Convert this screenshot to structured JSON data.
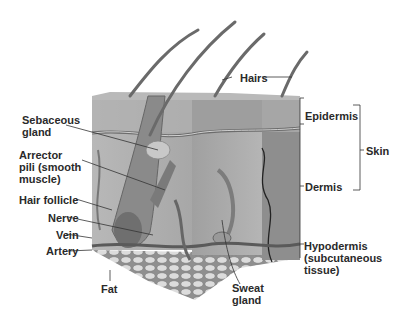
{
  "diagram": {
    "colors": {
      "background": "#ffffff",
      "skin_light": "#c4c4c4",
      "skin_mid": "#a9a9a9",
      "skin_dark": "#8a8a8a",
      "fat": "#d8d8d8",
      "label": "#2a2a2a",
      "leader": "#333333"
    },
    "labels": {
      "hairs": "Hairs",
      "epidermis": "Epidermis",
      "skin": "Skin",
      "dermis": "Dermis",
      "hypodermis_1": "Hypodermis",
      "hypodermis_2": "(subcutaneous",
      "hypodermis_3": "tissue)",
      "sebaceous_1": "Sebaceous",
      "sebaceous_2": "gland",
      "arrector_1": "Arrector",
      "arrector_2": "pili (smooth",
      "arrector_3": "muscle)",
      "hair_follicle": "Hair follicle",
      "nerve": "Nerve",
      "vein": "Vein",
      "artery": "Artery",
      "fat": "Fat",
      "sweat_1": "Sweat",
      "sweat_2": "gland"
    }
  }
}
